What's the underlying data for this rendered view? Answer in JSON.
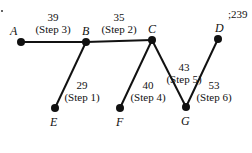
{
  "corner_text": ";239",
  "nodes": {
    "A": {
      "label": "A",
      "x": 21,
      "y": 42
    },
    "B": {
      "label": "B",
      "x": 86,
      "y": 42
    },
    "C": {
      "label": "C",
      "x": 152,
      "y": 40
    },
    "D": {
      "label": "D",
      "x": 218,
      "y": 39
    },
    "E": {
      "label": "E",
      "x": 55,
      "y": 108
    },
    "F": {
      "label": "F",
      "x": 120,
      "y": 108
    },
    "G": {
      "label": "G",
      "x": 186,
      "y": 107
    }
  },
  "edges": [
    {
      "from": "A",
      "to": "B",
      "weight": "39",
      "step": "(Step 3)"
    },
    {
      "from": "B",
      "to": "C",
      "weight": "35",
      "step": "(Step 2)"
    },
    {
      "from": "B",
      "to": "E",
      "weight": "29",
      "step": "(Step 1)"
    },
    {
      "from": "C",
      "to": "F",
      "weight": "40",
      "step": "(Step 4)"
    },
    {
      "from": "C",
      "to": "G",
      "weight": "43",
      "step": "(Step 5)"
    },
    {
      "from": "G",
      "to": "D",
      "weight": "53",
      "step": "(Step 6)"
    }
  ]
}
